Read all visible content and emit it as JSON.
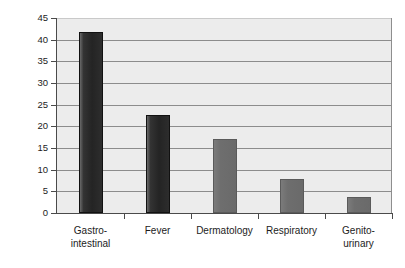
{
  "chart_data": {
    "type": "bar",
    "title": "",
    "xlabel": "",
    "ylabel": "% of ill returned travelers",
    "ylim": [
      0,
      45
    ],
    "ystep": 5,
    "grid": true,
    "legend": "none",
    "categories": [
      "Gastro-intestinal",
      "Fever",
      "Dermatology",
      "Respiratory",
      "Genito-urinary"
    ],
    "category_lines": [
      [
        "Gastro-",
        "intestinal"
      ],
      [
        "Fever",
        ""
      ],
      [
        "Dermatology",
        ""
      ],
      [
        "Respiratory",
        ""
      ],
      [
        "Genito-",
        "urinary"
      ]
    ],
    "values": [
      41.8,
      22.6,
      17.1,
      7.8,
      3.8
    ],
    "bar_colors": [
      "#2d2d2d",
      "#2d2d2d",
      "#6e6e6e",
      "#6e6e6e",
      "#6e6e6e"
    ],
    "ytick_labels": [
      "45",
      "40",
      "35",
      "30",
      "25",
      "20",
      "15",
      "10",
      "5",
      "0"
    ],
    "ytick_values": [
      45,
      40,
      35,
      30,
      25,
      20,
      15,
      10,
      5,
      0
    ],
    "plot_background": "#ececec",
    "gridline_color": "#8c8c8c",
    "axis_color": "#4a4a4a",
    "page_background": "#ffffff"
  }
}
